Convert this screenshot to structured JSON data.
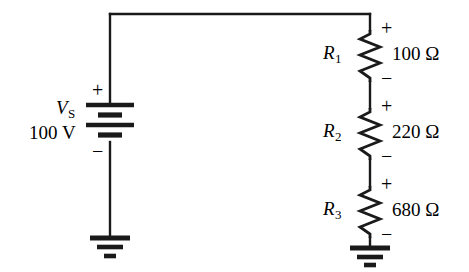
{
  "diagram": {
    "stroke_color": "#1a1a1a",
    "background_color": "#ffffff",
    "source": {
      "symbol_name": "battery-symbol",
      "name_main": "V",
      "name_sub": "S",
      "value": "100 V",
      "plus_sign": "+",
      "minus_sign": "−"
    },
    "resistors": [
      {
        "symbol_name": "resistor-symbol",
        "ref_main": "R",
        "ref_sub": "1",
        "value": "100 Ω",
        "plus_sign": "+",
        "minus_sign": "−"
      },
      {
        "symbol_name": "resistor-symbol",
        "ref_main": "R",
        "ref_sub": "2",
        "value": "220 Ω",
        "plus_sign": "+",
        "minus_sign": "−"
      },
      {
        "symbol_name": "resistor-symbol",
        "ref_main": "R",
        "ref_sub": "3",
        "value": "680 Ω",
        "plus_sign": "+",
        "minus_sign": "−"
      }
    ],
    "grounds": [
      {
        "label": "ground-left"
      },
      {
        "label": "ground-right"
      }
    ]
  }
}
